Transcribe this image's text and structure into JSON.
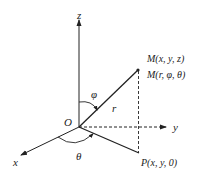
{
  "diagram": {
    "type": "spherical-coordinates",
    "origin_label": "O",
    "axes": {
      "x": "x",
      "y": "y",
      "z": "z"
    },
    "point_M_cartesian": "M(x, y, z)",
    "point_M_spherical": "M(r, φ, θ)",
    "point_P": "P(x, y, 0)",
    "radius_label": "r",
    "polar_angle_label": "φ",
    "azimuth_angle_label": "θ"
  },
  "colors": {
    "line": "#222222",
    "background": "#ffffff"
  }
}
